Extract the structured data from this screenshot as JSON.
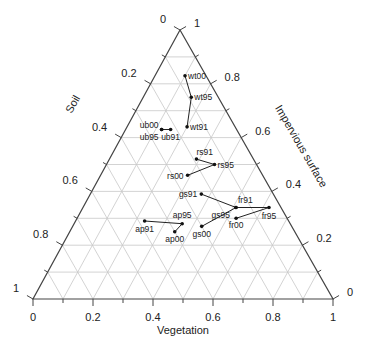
{
  "chart_data": {
    "type": "ternary",
    "title": "",
    "axes": {
      "bottom": {
        "label": "Vegetation",
        "ticks": [
          "0",
          "0.2",
          "0.4",
          "0.6",
          "0.8",
          "1"
        ]
      },
      "left": {
        "label": "Soil",
        "ticks": [
          "1",
          "0.8",
          "0.6",
          "0.4",
          "0.2",
          "0"
        ]
      },
      "right": {
        "label": "Impervious surface",
        "ticks": [
          "0",
          "0.2",
          "0.4",
          "0.6",
          "0.8",
          "1"
        ]
      }
    },
    "grid": true,
    "grid_step": 0.1,
    "series": [
      {
        "name": "wt",
        "points": [
          {
            "label": "wt91",
            "vegetation": 0.2,
            "impervious": 0.64,
            "soil": 0.16
          },
          {
            "label": "wt95",
            "vegetation": 0.16,
            "impervious": 0.75,
            "soil": 0.09
          },
          {
            "label": "wt00",
            "vegetation": 0.1,
            "impervious": 0.83,
            "soil": 0.07
          }
        ]
      },
      {
        "name": "ub",
        "points": [
          {
            "label": "ub91",
            "vegetation": 0.15,
            "impervious": 0.63,
            "soil": 0.22
          },
          {
            "label": "ub95",
            "vegetation": 0.12,
            "impervious": 0.63,
            "soil": 0.25
          },
          {
            "label": "ub00",
            "vegetation": 0.12,
            "impervious": 0.63,
            "soil": 0.25
          }
        ]
      },
      {
        "name": "rs",
        "points": [
          {
            "label": "rs91",
            "vegetation": 0.29,
            "impervious": 0.52,
            "soil": 0.19
          },
          {
            "label": "rs95",
            "vegetation": 0.36,
            "impervious": 0.5,
            "soil": 0.14
          },
          {
            "label": "rs00",
            "vegetation": 0.29,
            "impervious": 0.46,
            "soil": 0.25
          }
        ]
      },
      {
        "name": "gs",
        "points": [
          {
            "label": "gs91",
            "vegetation": 0.37,
            "impervious": 0.39,
            "soil": 0.24
          },
          {
            "label": "gs95",
            "vegetation": 0.51,
            "impervious": 0.34,
            "soil": 0.15
          },
          {
            "label": "gs00",
            "vegetation": 0.43,
            "impervious": 0.27,
            "soil": 0.3
          }
        ]
      },
      {
        "name": "fr",
        "points": [
          {
            "label": "fr91",
            "vegetation": 0.51,
            "impervious": 0.34,
            "soil": 0.15
          },
          {
            "label": "fr95",
            "vegetation": 0.62,
            "impervious": 0.34,
            "soil": 0.04
          },
          {
            "label": "fr00",
            "vegetation": 0.53,
            "impervious": 0.3,
            "soil": 0.17
          }
        ]
      },
      {
        "name": "ap",
        "points": [
          {
            "label": "ap91",
            "vegetation": 0.23,
            "impervious": 0.29,
            "soil": 0.48
          },
          {
            "label": "ap95",
            "vegetation": 0.36,
            "impervious": 0.28,
            "soil": 0.36
          },
          {
            "label": "ap00",
            "vegetation": 0.35,
            "impervious": 0.25,
            "soil": 0.4
          }
        ]
      }
    ]
  },
  "labels": {
    "bottom_axis": "Vegetation",
    "left_axis": "Soil",
    "right_axis": "Impervious surface",
    "bottom_ticks": [
      "0",
      "0.2",
      "0.4",
      "0.6",
      "0.8",
      "1"
    ],
    "left_ticks": [
      "1",
      "0.8",
      "0.6",
      "0.4",
      "0.2",
      "0"
    ],
    "right_ticks": [
      "0",
      "0.2",
      "0.4",
      "0.6",
      "0.8",
      "1"
    ]
  }
}
